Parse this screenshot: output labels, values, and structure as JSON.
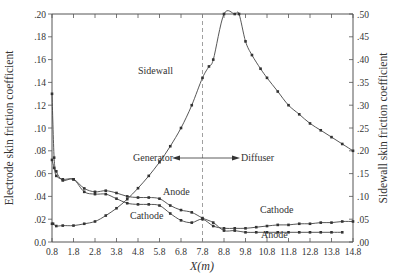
{
  "chart_data": {
    "type": "line",
    "title": "",
    "xlabel": "X(m)",
    "ylabel_left": "Electrode skin friction coefficient",
    "ylabel_right": "Sidewall skin friction coefficient",
    "xlim": [
      0.8,
      14.8
    ],
    "ylim_left": [
      0.0,
      0.2
    ],
    "ylim_right": [
      0.0,
      0.5
    ],
    "x_ticks": [
      "0.8",
      "1.8",
      "2.8",
      "3.8",
      "4.8",
      "5.8",
      "6.8",
      "7.8",
      "8.8",
      "9.8",
      "10.8",
      "11.8",
      "12.8",
      "13.8",
      "14.8"
    ],
    "y_ticks_left": [
      "0.0",
      ".02",
      ".04",
      ".06",
      ".08",
      ".10",
      ".12",
      ".14",
      ".16",
      ".18",
      ".20"
    ],
    "y_ticks_right": [
      ".00",
      ".05",
      ".10",
      ".15",
      ".20",
      ".25",
      ".30",
      ".35",
      ".40",
      ".45",
      ".50"
    ],
    "grid": false,
    "divider_x": 7.8,
    "annotations": {
      "generator": "Generator",
      "diffuser": "Diffuser",
      "sidewall": "Sidewall",
      "anode_upper": "Anode",
      "cathode_lower": "Cathode",
      "cathode_upper": "Cathode",
      "anode_lower": "Anode"
    },
    "series": [
      {
        "name": "Sidewall",
        "axis": "right",
        "x": [
          0.8,
          0.85,
          1.0,
          1.3,
          1.8,
          2.3,
          2.8,
          3.3,
          3.8,
          4.3,
          4.8,
          5.3,
          5.8,
          6.3,
          6.8,
          7.3,
          7.8,
          8.1,
          8.3,
          8.8,
          9.3,
          9.5,
          9.8,
          10.1,
          10.5,
          10.8,
          11.3,
          11.8,
          12.3,
          12.8,
          13.3,
          13.8,
          14.3,
          14.8
        ],
        "y": [
          0.04,
          0.04,
          0.035,
          0.036,
          0.036,
          0.04,
          0.045,
          0.058,
          0.074,
          0.094,
          0.118,
          0.145,
          0.175,
          0.21,
          0.25,
          0.3,
          0.36,
          0.385,
          0.4,
          0.5,
          0.5,
          0.5,
          0.44,
          0.41,
          0.38,
          0.36,
          0.33,
          0.3,
          0.28,
          0.26,
          0.245,
          0.23,
          0.215,
          0.2
        ]
      },
      {
        "name": "Anode",
        "axis": "left",
        "x": [
          0.8,
          0.9,
          1.0,
          1.3,
          1.8,
          2.3,
          2.8,
          3.3,
          3.8,
          4.3,
          4.8,
          5.3,
          5.8,
          6.3,
          6.8,
          7.3,
          7.8,
          8.3,
          8.8,
          9.3,
          9.8,
          10.3,
          10.8,
          11.3,
          11.8,
          12.3,
          12.8,
          13.3,
          13.8,
          14.3
        ],
        "y": [
          0.072,
          0.065,
          0.058,
          0.055,
          0.055,
          0.047,
          0.044,
          0.045,
          0.043,
          0.04,
          0.039,
          0.039,
          0.038,
          0.032,
          0.028,
          0.026,
          0.021,
          0.017,
          0.01,
          0.01,
          0.0085,
          0.0085,
          0.0085,
          0.0085,
          0.0085,
          0.0085,
          0.0085,
          0.0085,
          0.0085,
          0.0085
        ]
      },
      {
        "name": "Cathode",
        "axis": "left",
        "x": [
          0.8,
          0.9,
          1.0,
          1.3,
          1.8,
          2.3,
          2.8,
          3.3,
          3.8,
          4.3,
          4.8,
          5.3,
          5.8,
          6.3,
          6.8,
          7.3,
          7.8,
          8.3,
          8.8,
          9.3,
          9.8,
          10.3,
          10.8,
          11.3,
          11.8,
          12.3,
          12.8,
          13.3,
          13.8,
          14.3,
          14.8
        ],
        "y": [
          0.13,
          0.074,
          0.062,
          0.054,
          0.055,
          0.044,
          0.042,
          0.042,
          0.038,
          0.034,
          0.033,
          0.033,
          0.032,
          0.025,
          0.019,
          0.017,
          0.02,
          0.014,
          0.012,
          0.012,
          0.012,
          0.013,
          0.014,
          0.015,
          0.015,
          0.016,
          0.016,
          0.017,
          0.017,
          0.018,
          0.018
        ]
      }
    ]
  }
}
